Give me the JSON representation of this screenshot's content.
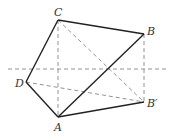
{
  "diagram": {
    "type": "geometry",
    "points": {
      "A": {
        "label": "A",
        "x": 58,
        "y": 117
      },
      "B": {
        "label": "B",
        "x": 144,
        "y": 34
      },
      "Bp": {
        "label": "B′",
        "x": 144,
        "y": 102
      },
      "C": {
        "label": "C",
        "x": 58,
        "y": 20
      },
      "D": {
        "label": "D",
        "x": 26,
        "y": 82
      }
    },
    "solid_segments": [
      [
        "A",
        "D"
      ],
      [
        "D",
        "C"
      ],
      [
        "C",
        "B"
      ],
      [
        "B",
        "A"
      ],
      [
        "A",
        "Bp"
      ]
    ],
    "dashed_segments": [
      [
        "C",
        "A"
      ],
      [
        "C",
        "Bp"
      ],
      [
        "D",
        "Bp"
      ],
      [
        "B",
        "Bp"
      ]
    ],
    "axis_line": {
      "x1": 8,
      "y1": 69,
      "x2": 168,
      "y2": 69,
      "style": "dashed"
    }
  }
}
